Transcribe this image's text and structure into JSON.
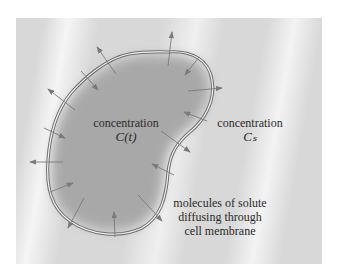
{
  "diagram": {
    "inside_label": {
      "line1": "concentration",
      "line2": "C(t)"
    },
    "outside_label": {
      "line1": "concentration",
      "line2": "Cₛ"
    },
    "note": {
      "line1": "molecules of solute",
      "line2": "diffusing through",
      "line3": "cell membrane"
    },
    "colors": {
      "background": "#d8d8d8",
      "cell_fill": "#a8a8a8",
      "membrane": "#6e6e6e",
      "arrow": "#7a7a7a",
      "text": "#2a2a2a"
    },
    "arrows": [
      {
        "from": [
          168,
          66
        ],
        "to": [
          172,
          32
        ],
        "direction": "outward"
      },
      {
        "from": [
          199,
          57
        ],
        "to": [
          185,
          75
        ],
        "direction": "inward"
      },
      {
        "from": [
          188,
          91
        ],
        "to": [
          222,
          88
        ],
        "direction": "outward"
      },
      {
        "from": [
          207,
          121
        ],
        "to": [
          184,
          112
        ],
        "direction": "inward"
      },
      {
        "from": [
          161,
          131
        ],
        "to": [
          190,
          152
        ],
        "direction": "outward"
      },
      {
        "from": [
          174,
          175
        ],
        "to": [
          152,
          164
        ],
        "direction": "inward"
      },
      {
        "from": [
          138,
          195
        ],
        "to": [
          162,
          221
        ],
        "direction": "outward"
      },
      {
        "from": [
          115,
          237
        ],
        "to": [
          114,
          212
        ],
        "direction": "inward"
      },
      {
        "from": [
          84,
          198
        ],
        "to": [
          68,
          228
        ],
        "direction": "outward"
      },
      {
        "from": [
          50,
          192
        ],
        "to": [
          73,
          183
        ],
        "direction": "inward"
      },
      {
        "from": [
          63,
          162
        ],
        "to": [
          30,
          162
        ],
        "direction": "outward"
      },
      {
        "from": [
          44,
          128
        ],
        "to": [
          65,
          138
        ],
        "direction": "inward"
      },
      {
        "from": [
          75,
          110
        ],
        "to": [
          48,
          89
        ],
        "direction": "outward"
      },
      {
        "from": [
          81,
          71
        ],
        "to": [
          98,
          90
        ],
        "direction": "inward"
      },
      {
        "from": [
          116,
          74
        ],
        "to": [
          97,
          47
        ],
        "direction": "outward"
      }
    ]
  }
}
